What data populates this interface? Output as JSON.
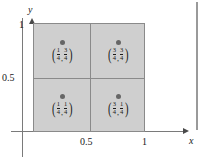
{
  "figure": {
    "colors": {
      "square_fill": "#cfcfcf",
      "square_border": "#8a8a8a",
      "axis": "#7a7a7a",
      "dot": "#666666",
      "text": "#1a1a1a"
    }
  },
  "axes": {
    "x_name": "x",
    "y_name": "y",
    "x_ticks": [
      {
        "label": "0.5",
        "value": 0.5
      },
      {
        "label": "1",
        "value": 1
      }
    ],
    "y_ticks": [
      {
        "label": "0.5",
        "value": 0.5
      },
      {
        "label": "1",
        "value": 1
      }
    ]
  },
  "chart_data": {
    "type": "scatter",
    "title": "",
    "xlabel": "x",
    "ylabel": "y",
    "xlim": [
      0,
      1
    ],
    "ylim": [
      0,
      1
    ],
    "grid": true,
    "points": [
      {
        "x": 0.25,
        "y": 0.75,
        "label_x_num": "1",
        "label_x_den": "4",
        "label_y_num": "3",
        "label_y_den": "4"
      },
      {
        "x": 0.75,
        "y": 0.75,
        "label_x_num": "3",
        "label_x_den": "4",
        "label_y_num": "3",
        "label_y_den": "4"
      },
      {
        "x": 0.25,
        "y": 0.25,
        "label_x_num": "1",
        "label_x_den": "4",
        "label_y_num": "1",
        "label_y_den": "4"
      },
      {
        "x": 0.75,
        "y": 0.25,
        "label_x_num": "3",
        "label_x_den": "4",
        "label_y_num": "1",
        "label_y_den": "4"
      }
    ]
  },
  "glyphs": {
    "open_paren": "(",
    "close_paren": ")",
    "comma": ","
  }
}
